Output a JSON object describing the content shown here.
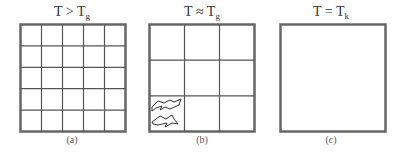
{
  "figure": {
    "panels": [
      {
        "id": "a",
        "title_main": "T > T",
        "title_sub": "g",
        "caption": "(a)",
        "grid_divisions": 5,
        "has_clusters": false
      },
      {
        "id": "b",
        "title_main": "T ≈ T",
        "title_sub": "g",
        "caption": "(b)",
        "grid_divisions": 3,
        "has_clusters": true,
        "cluster_cell": "bottom-left",
        "cluster_count": 2
      },
      {
        "id": "c",
        "title_main": "T = T",
        "title_sub": "k",
        "caption": "(c)",
        "grid_divisions": 1,
        "has_clusters": false
      }
    ],
    "colors": {
      "border": "#666666",
      "grid_line": "#555555",
      "background": "#ffffff"
    }
  }
}
